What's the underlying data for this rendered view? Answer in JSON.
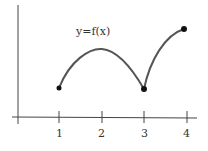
{
  "diagram": {
    "function_label": "y=f(x)",
    "x_ticks": [
      "1",
      "2",
      "3",
      "4"
    ],
    "points": [
      {
        "x": 1,
        "label": "closed point at x=1"
      },
      {
        "x": 3,
        "label": "closed point at x=3 (cusp)"
      },
      {
        "x": 4,
        "label": "closed point at x=4"
      }
    ],
    "colors": {
      "curve": "#555555",
      "axes": "#444444",
      "points": "#111111"
    }
  }
}
